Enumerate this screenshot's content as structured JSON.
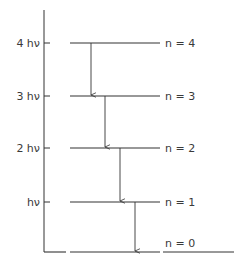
{
  "diagram": {
    "title": "",
    "axis": {
      "x": 44,
      "y_top": 10,
      "y_bottom": 252
    },
    "line_color": "#333333",
    "levels": [
      {
        "n_label": "n = 4",
        "energy_label": "4 hν",
        "y": 43
      },
      {
        "n_label": "n = 3",
        "energy_label": "3 hν",
        "y": 96
      },
      {
        "n_label": "n = 2",
        "energy_label": "2 hν",
        "y": 148
      },
      {
        "n_label": "n = 1",
        "energy_label": "hν",
        "y": 202
      },
      {
        "n_label": "n = 0",
        "energy_label": "",
        "y": 252
      }
    ],
    "transitions": [
      {
        "from": "n = 4",
        "to": "n = 3",
        "x": 91
      },
      {
        "from": "n = 3",
        "to": "n = 2",
        "x": 105
      },
      {
        "from": "n = 2",
        "to": "n = 1",
        "x": 120
      },
      {
        "from": "n = 1",
        "to": "n = 0",
        "x": 135
      }
    ]
  }
}
